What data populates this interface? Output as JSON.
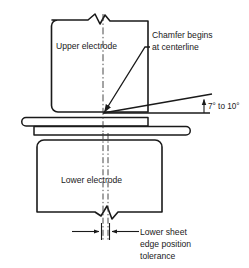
{
  "figure": {
    "kind": "technical-cross-section-diagram",
    "line_color": "#1a1a1a",
    "background_color": "#ffffff"
  },
  "labels": {
    "upper_electrode": "Upper electrode",
    "lower_electrode": "Lower electrode",
    "chamfer_note_line1": "Chamfer begins",
    "chamfer_note_line2": "at centerline",
    "angle_note": "7° to 10°",
    "tolerance_line1": "Lower sheet",
    "tolerance_line2": "edge position",
    "tolerance_line3": "tolerance"
  },
  "annotations": {
    "angle_min_deg": 7,
    "angle_max_deg": 10,
    "angle_units": "degrees"
  },
  "parts": [
    {
      "name": "upper-electrode",
      "label": "Upper electrode"
    },
    {
      "name": "lower-electrode",
      "label": "Lower electrode"
    },
    {
      "name": "upper-sheet",
      "label": ""
    },
    {
      "name": "lower-sheet",
      "label": ""
    }
  ],
  "symbols": [
    {
      "name": "break-symbol-top",
      "kind": "zigzag-break"
    },
    {
      "name": "break-symbol-bottom",
      "kind": "zigzag-break"
    },
    {
      "name": "centerline",
      "kind": "dash-dot-axis"
    },
    {
      "name": "tolerance-band",
      "kind": "dash-dot-pair"
    },
    {
      "name": "leader-arrow-chamfer",
      "kind": "leader-with-arrowhead"
    },
    {
      "name": "angle-dimension-arrow",
      "kind": "vertical-arrow"
    },
    {
      "name": "tolerance-dimension-arrows",
      "kind": "inward-arrow-pair"
    }
  ]
}
